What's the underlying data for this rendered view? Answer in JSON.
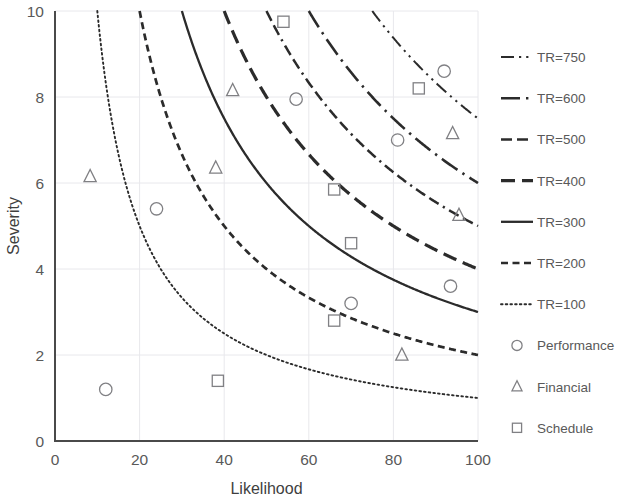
{
  "chart_data": {
    "type": "scatter",
    "title": "",
    "xlabel": "Likelihood",
    "ylabel": "Severity",
    "xlim": [
      0,
      100
    ],
    "ylim": [
      0,
      10
    ],
    "xticks": [
      0,
      20,
      40,
      60,
      80,
      100
    ],
    "yticks": [
      0,
      2,
      4,
      6,
      8,
      10
    ],
    "grid": true,
    "legend_position": "right",
    "iso_curves": [
      {
        "name": "TR=750",
        "value": 750,
        "style": "dash-dot-dot"
      },
      {
        "name": "TR=600",
        "value": 600,
        "style": "long-dash-dot"
      },
      {
        "name": "TR=500",
        "value": 500,
        "style": "dash-dash-dot"
      },
      {
        "name": "TR=400",
        "value": 400,
        "style": "long-dash"
      },
      {
        "name": "TR=300",
        "value": 300,
        "style": "solid"
      },
      {
        "name": "TR=200",
        "value": 200,
        "style": "dashed"
      },
      {
        "name": "TR=100",
        "value": 100,
        "style": "dotted"
      }
    ],
    "series": [
      {
        "name": "Performance",
        "marker": "circle",
        "points": [
          {
            "x": 12,
            "y": 1.2
          },
          {
            "x": 24,
            "y": 5.4
          },
          {
            "x": 57,
            "y": 7.95
          },
          {
            "x": 70,
            "y": 3.2
          },
          {
            "x": 81,
            "y": 7.0
          },
          {
            "x": 92,
            "y": 8.6
          },
          {
            "x": 93.5,
            "y": 3.6
          }
        ]
      },
      {
        "name": "Financial",
        "marker": "triangle",
        "points": [
          {
            "x": 8.3,
            "y": 6.15
          },
          {
            "x": 38,
            "y": 6.35
          },
          {
            "x": 42,
            "y": 8.15
          },
          {
            "x": 82,
            "y": 2.0
          },
          {
            "x": 94,
            "y": 7.15
          },
          {
            "x": 95.5,
            "y": 5.25
          }
        ]
      },
      {
        "name": "Schedule",
        "marker": "square",
        "points": [
          {
            "x": 38.5,
            "y": 1.4
          },
          {
            "x": 54,
            "y": 9.75
          },
          {
            "x": 66,
            "y": 2.8
          },
          {
            "x": 66,
            "y": 5.85
          },
          {
            "x": 70,
            "y": 4.6
          },
          {
            "x": 86,
            "y": 8.2
          }
        ]
      }
    ],
    "legend_entries": [
      {
        "label": "TR=750",
        "kind": "line",
        "style": "dash-dot-dot"
      },
      {
        "label": "TR=600",
        "kind": "line",
        "style": "long-dash-dot"
      },
      {
        "label": "TR=500",
        "kind": "line",
        "style": "dash-dash-dot"
      },
      {
        "label": "TR=400",
        "kind": "line",
        "style": "long-dash"
      },
      {
        "label": "TR=300",
        "kind": "line",
        "style": "solid"
      },
      {
        "label": "TR=200",
        "kind": "line",
        "style": "dashed"
      },
      {
        "label": "TR=100",
        "kind": "line",
        "style": "dotted"
      },
      {
        "label": "Performance",
        "kind": "marker",
        "style": "circle"
      },
      {
        "label": "Financial",
        "kind": "marker",
        "style": "triangle"
      },
      {
        "label": "Schedule",
        "kind": "marker",
        "style": "square"
      }
    ],
    "colors": {
      "curve": "#2b2b2b",
      "marker": "#808084",
      "grid": "#e8e8ec",
      "axis": "#4a4a4a",
      "text": "#595959"
    }
  }
}
